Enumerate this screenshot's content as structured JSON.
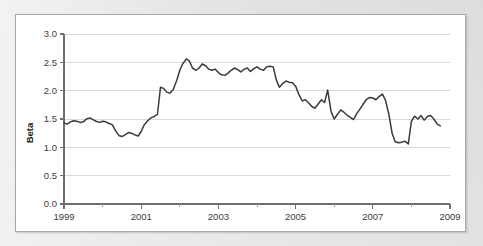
{
  "figure": {
    "panel_background": "#ffffff",
    "page_background": "#e9e9e9",
    "border_color": "#a9a9a9"
  },
  "chart_data": {
    "type": "line",
    "title": "",
    "subtitle": "",
    "xlabel": "",
    "ylabel": "Beta",
    "xlim": [
      1999,
      2009
    ],
    "ylim": [
      0.0,
      3.0
    ],
    "grid": "horizontal",
    "legend": "none",
    "line_color": "#3a3a3a",
    "grid_color": "#d9d9d9",
    "axis_color": "#6f6f6f",
    "ytick_labels": [
      "0.0",
      "0.5",
      "1.0",
      "1.5",
      "2.0",
      "2.5",
      "3.0"
    ],
    "ytick_values": [
      0.0,
      0.5,
      1.0,
      1.5,
      2.0,
      2.5,
      3.0
    ],
    "xtick_labels": [
      "1999",
      "2001",
      "2003",
      "2005",
      "2007",
      "2009"
    ],
    "xtick_values": [
      1999,
      2001,
      2003,
      2005,
      2007,
      2009
    ],
    "xtick_minor_values": [
      2000,
      2002,
      2004,
      2006,
      2008
    ],
    "series": [
      {
        "name": "Beta",
        "x": [
          1999.0,
          1999.08,
          1999.17,
          1999.25,
          1999.33,
          1999.42,
          1999.5,
          1999.58,
          1999.67,
          1999.75,
          1999.83,
          1999.92,
          2000.0,
          2000.08,
          2000.17,
          2000.25,
          2000.33,
          2000.42,
          2000.5,
          2000.58,
          2000.67,
          2000.75,
          2000.83,
          2000.92,
          2001.0,
          2001.08,
          2001.17,
          2001.25,
          2001.33,
          2001.42,
          2001.5,
          2001.58,
          2001.67,
          2001.75,
          2001.83,
          2001.92,
          2002.0,
          2002.08,
          2002.17,
          2002.25,
          2002.33,
          2002.42,
          2002.5,
          2002.58,
          2002.67,
          2002.75,
          2002.83,
          2002.92,
          2003.0,
          2003.08,
          2003.17,
          2003.25,
          2003.33,
          2003.42,
          2003.5,
          2003.58,
          2003.67,
          2003.75,
          2003.83,
          2003.92,
          2004.0,
          2004.08,
          2004.17,
          2004.25,
          2004.33,
          2004.42,
          2004.5,
          2004.58,
          2004.67,
          2004.75,
          2004.83,
          2004.92,
          2005.0,
          2005.08,
          2005.17,
          2005.25,
          2005.33,
          2005.42,
          2005.5,
          2005.58,
          2005.67,
          2005.75,
          2005.83,
          2005.92,
          2006.0,
          2006.08,
          2006.17,
          2006.25,
          2006.33,
          2006.42,
          2006.5,
          2006.58,
          2006.67,
          2006.75,
          2006.83,
          2006.92,
          2007.0,
          2007.08,
          2007.17,
          2007.25,
          2007.33,
          2007.42,
          2007.5,
          2007.58,
          2007.67,
          2007.75,
          2007.83,
          2007.92,
          2008.0,
          2008.08,
          2008.17,
          2008.25,
          2008.33,
          2008.42,
          2008.5,
          2008.58,
          2008.67,
          2008.75
        ],
        "y": [
          1.43,
          1.41,
          1.45,
          1.47,
          1.46,
          1.44,
          1.45,
          1.5,
          1.52,
          1.49,
          1.46,
          1.44,
          1.46,
          1.45,
          1.42,
          1.4,
          1.3,
          1.21,
          1.19,
          1.22,
          1.26,
          1.25,
          1.22,
          1.2,
          1.28,
          1.4,
          1.47,
          1.52,
          1.54,
          1.58,
          2.06,
          2.04,
          1.97,
          1.96,
          2.02,
          2.18,
          2.36,
          2.48,
          2.56,
          2.52,
          2.4,
          2.36,
          2.4,
          2.47,
          2.44,
          2.38,
          2.36,
          2.38,
          2.32,
          2.28,
          2.27,
          2.31,
          2.36,
          2.4,
          2.37,
          2.33,
          2.38,
          2.4,
          2.34,
          2.39,
          2.42,
          2.38,
          2.36,
          2.42,
          2.43,
          2.42,
          2.19,
          2.06,
          2.13,
          2.17,
          2.15,
          2.14,
          2.08,
          1.94,
          1.82,
          1.84,
          1.79,
          1.72,
          1.69,
          1.76,
          1.84,
          1.79,
          2.01,
          1.63,
          1.5,
          1.58,
          1.66,
          1.62,
          1.57,
          1.53,
          1.49,
          1.59,
          1.68,
          1.76,
          1.84,
          1.88,
          1.87,
          1.84,
          1.9,
          1.94,
          1.83,
          1.57,
          1.25,
          1.1,
          1.08,
          1.09,
          1.11,
          1.06,
          1.46,
          1.55,
          1.5,
          1.56,
          1.48,
          1.55,
          1.56,
          1.5,
          1.41,
          1.38
        ]
      }
    ]
  }
}
